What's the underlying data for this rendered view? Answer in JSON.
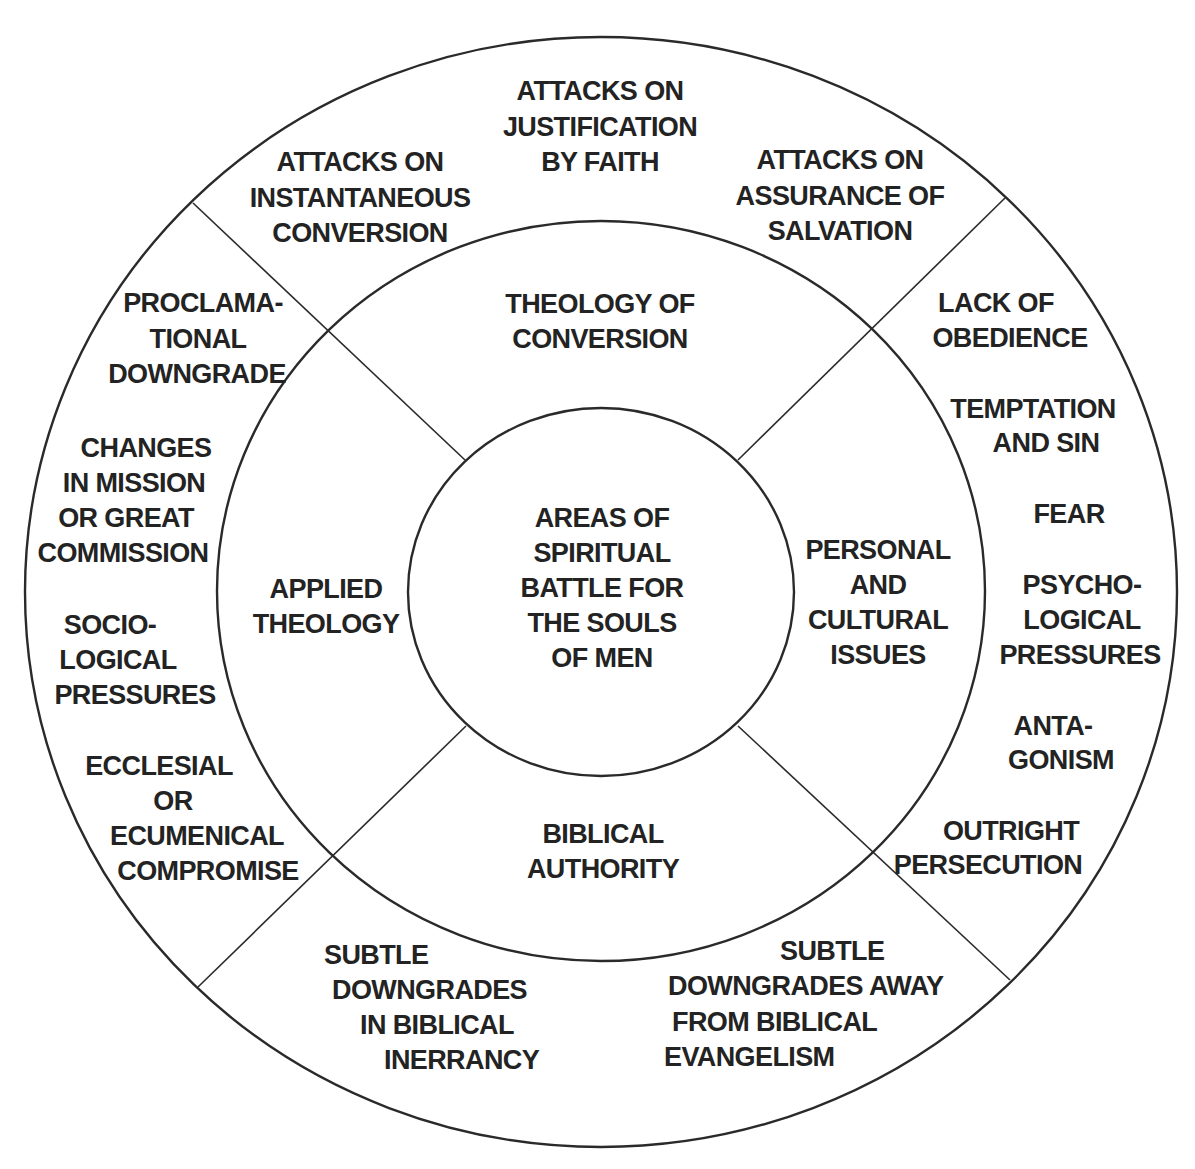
{
  "center": {
    "lines": [
      "AREAS OF",
      "SPIRITUAL",
      "BATTLE FOR",
      "THE SOULS",
      "OF MEN"
    ]
  },
  "middle_ring": {
    "top": [
      "THEOLOGY OF",
      "CONVERSION"
    ],
    "right": [
      "PERSONAL",
      "AND",
      "CULTURAL",
      "ISSUES"
    ],
    "bottom": [
      "BIBLICAL",
      "AUTHORITY"
    ],
    "left": [
      "APPLIED",
      "THEOLOGY"
    ]
  },
  "outer_ring": {
    "top": [
      [
        "ATTACKS ON",
        "INSTANTANEOUS",
        "CONVERSION"
      ],
      [
        "ATTACKS ON",
        "JUSTIFICATION",
        "BY FAITH"
      ],
      [
        "ATTACKS ON",
        "ASSURANCE OF",
        "SALVATION"
      ]
    ],
    "right": [
      [
        "LACK OF",
        "OBEDIENCE"
      ],
      [
        "TEMPTATION",
        "AND SIN"
      ],
      [
        "FEAR"
      ],
      [
        "PSYCHO-",
        "LOGICAL",
        "PRESSURES"
      ],
      [
        "ANTA-",
        "GONISM"
      ],
      [
        "OUTRIGHT",
        "PERSECUTION"
      ]
    ],
    "bottom": [
      [
        "SUBTLE",
        "DOWNGRADES",
        "IN BIBLICAL",
        "INERRANCY"
      ],
      [
        "SUBTLE",
        "DOWNGRADES AWAY",
        "FROM BIBLICAL",
        "EVANGELISM"
      ]
    ],
    "left": [
      [
        "PROCLAMA-",
        "TIONAL",
        "DOWNGRADE"
      ],
      [
        "CHANGES",
        "IN MISSION",
        "OR GREAT",
        "COMMISSION"
      ],
      [
        "SOCIO-",
        "LOGICAL",
        "PRESSURES"
      ],
      [
        "ECCLESIAL",
        "OR",
        "ECUMENICAL",
        "COMPROMISE"
      ]
    ]
  }
}
